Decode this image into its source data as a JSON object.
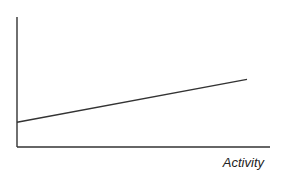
{
  "chart_data": {
    "type": "line",
    "title": "",
    "xlabel": "Activity",
    "ylabel": "",
    "grid": false,
    "legend": null,
    "series": [
      {
        "name": "cost",
        "x": [
          0,
          1
        ],
        "y": [
          0.19,
          0.52
        ]
      }
    ],
    "xlim": [
      0,
      1.1
    ],
    "ylim": [
      0,
      1
    ],
    "colors": {
      "axis": "#333333",
      "line": "#333333"
    }
  }
}
